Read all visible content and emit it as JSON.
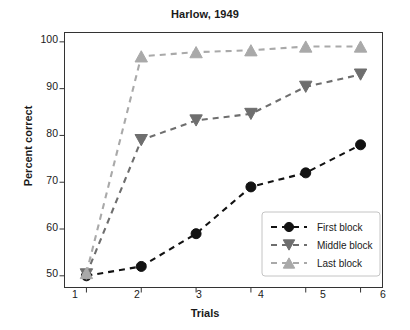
{
  "chart_data": {
    "type": "line",
    "title": "Harlow, 1949",
    "xlabel": "Trials",
    "ylabel": "Percent correct",
    "x": [
      1,
      2,
      3,
      4,
      5,
      6
    ],
    "xticklabels": [
      "1",
      "2",
      "3",
      "4",
      "5",
      "6"
    ],
    "yticklabels": [
      "50",
      "60",
      "70",
      "80",
      "90",
      "100"
    ],
    "yticks": [
      50,
      60,
      70,
      80,
      90,
      100
    ],
    "xlim": [
      0.6,
      6.4
    ],
    "ylim": [
      47.5,
      102
    ],
    "grid": false,
    "legend_position": "lower right",
    "series": [
      {
        "name": "First block",
        "values": [
          50,
          52,
          59,
          69,
          72,
          78
        ],
        "color": "#121212",
        "marker": "circle",
        "linestyle": "dashed"
      },
      {
        "name": "Middle block",
        "values": [
          50.3,
          79,
          83.2,
          84.6,
          90.4,
          93
        ],
        "color": "#6e6e6e",
        "marker": "triangle-down",
        "linestyle": "dashed"
      },
      {
        "name": "Last block",
        "values": [
          50.6,
          96.9,
          97.8,
          98.2,
          99,
          99
        ],
        "color": "#a9a9a9",
        "marker": "triangle-up",
        "linestyle": "dashed"
      }
    ]
  },
  "legend": {
    "entries": [
      "First block",
      "Middle block",
      "Last block"
    ]
  },
  "axes": {
    "frame_color": "#333333",
    "background": "#ffffff"
  }
}
